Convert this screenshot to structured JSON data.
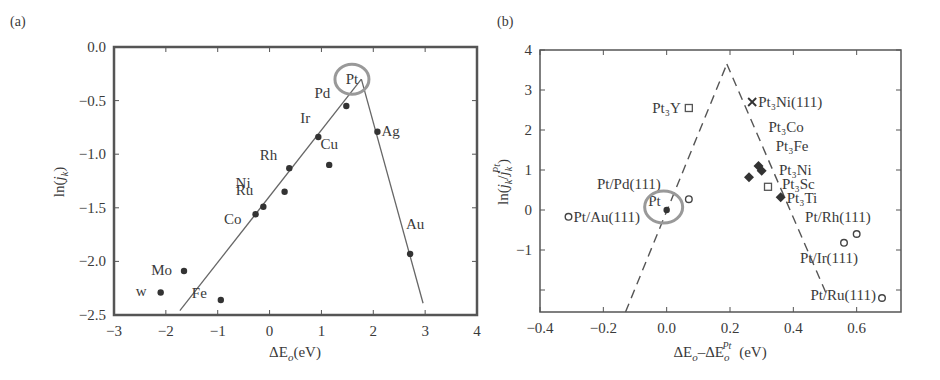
{
  "panels": [
    {
      "label": "(a)"
    },
    {
      "label": "(b)"
    }
  ],
  "chart_data": [
    {
      "type": "scatter",
      "panel_label": "(a)",
      "title": "",
      "xlabel": "ΔE_o (eV)",
      "ylabel": "ln(j_k)",
      "xlim": [
        -3,
        4
      ],
      "ylim": [
        -2.5,
        0.0
      ],
      "xticks": [
        -3,
        -2,
        -1,
        0,
        1,
        2,
        3,
        4
      ],
      "xtick_labels": [
        "−3",
        "−2",
        "−1",
        "0",
        "1",
        "2",
        "3",
        "4"
      ],
      "yticks": [
        0.0,
        -0.5,
        -1.0,
        -1.5,
        -2.0,
        -2.5
      ],
      "ytick_labels": [
        "0.0",
        "−0.5",
        "−1.0",
        "−1.5",
        "−2.0",
        "−2.5"
      ],
      "grid": false,
      "points": [
        {
          "label": "Pd",
          "x": 1.48,
          "y": -0.55,
          "lx": -16,
          "ly": -8,
          "anchor": "end"
        },
        {
          "label": "Ir",
          "x": 0.94,
          "y": -0.84,
          "lx": -8,
          "ly": -14,
          "anchor": "end"
        },
        {
          "label": "Ag",
          "x": 2.08,
          "y": -0.79,
          "lx": 4,
          "ly": 4,
          "anchor": "start"
        },
        {
          "label": "Cu",
          "x": 1.15,
          "y": -1.1,
          "lx": 0,
          "ly": -16,
          "anchor": "middle"
        },
        {
          "label": "Rh",
          "x": 0.38,
          "y": -1.13,
          "lx": -12,
          "ly": -8,
          "anchor": "end"
        },
        {
          "label": "Ni",
          "x": 0.29,
          "y": -1.35,
          "lx": -34,
          "ly": -4,
          "anchor": "end"
        },
        {
          "label": "Ru",
          "x": -0.12,
          "y": -1.49,
          "lx": -10,
          "ly": -12,
          "anchor": "end"
        },
        {
          "label": "Co",
          "x": -0.27,
          "y": -1.56,
          "lx": -14,
          "ly": 10,
          "anchor": "end"
        },
        {
          "label": "Au",
          "x": 2.71,
          "y": -1.93,
          "lx": 5,
          "ly": -25,
          "anchor": "middle"
        },
        {
          "label": "Mo",
          "x": -1.65,
          "y": -2.09,
          "lx": -12,
          "ly": 4,
          "anchor": "end"
        },
        {
          "label": "W",
          "x": -2.1,
          "y": -2.29,
          "lx": -14,
          "ly": 4,
          "anchor": "end",
          "display": "w"
        },
        {
          "label": "Fe",
          "x": -0.94,
          "y": -2.36,
          "lx": -14,
          "ly": -2,
          "anchor": "end"
        }
      ],
      "trend_lines": [
        {
          "style": "solid",
          "x": [
            -1.73,
            1.77
          ],
          "y": [
            -2.46,
            -0.3
          ]
        },
        {
          "style": "solid",
          "x": [
            1.77,
            2.96
          ],
          "y": [
            -0.3,
            -2.39
          ]
        }
      ],
      "annotations": [
        {
          "text": "Pt",
          "x": 1.55,
          "y": -0.3,
          "circled": true
        }
      ]
    },
    {
      "type": "scatter",
      "panel_label": "(b)",
      "title": "",
      "xlabel": "ΔE_o − ΔE_o^Pt (eV)",
      "ylabel": "ln(j_k / j_k^Pt)",
      "xlim": [
        -0.4,
        0.74
      ],
      "ylim": [
        -2.55,
        4
      ],
      "xticks": [
        -0.4,
        -0.2,
        0.0,
        0.2,
        0.4,
        0.6
      ],
      "xtick_labels": [
        "−0.4",
        "−0.2",
        "0.0",
        "0.2",
        "0.4",
        "0.6"
      ],
      "yticks": [
        4,
        3,
        2,
        1,
        0,
        -1,
        -2
      ],
      "ytick_labels": [
        "4",
        "3",
        "2",
        "1",
        "0",
        "−1",
        ""
      ],
      "grid": false,
      "points": [
        {
          "label": "Pt3Y",
          "x": 0.07,
          "y": 2.55,
          "marker": "open-square",
          "lx": -8,
          "ly": 5,
          "anchor": "end",
          "display": "Pt₃Y"
        },
        {
          "label": "Pt3Ni(111)",
          "x": 0.27,
          "y": 2.7,
          "marker": "cross",
          "lx": 6,
          "ly": 5,
          "anchor": "start",
          "display": "Pt₃Ni(111)"
        },
        {
          "label": "Pt3Co",
          "x": 0.29,
          "y": 1.1,
          "marker": "filled-diamond",
          "lx": 10,
          "ly": -34,
          "anchor": "start",
          "display": "Pt₃Co"
        },
        {
          "label": "Pt3Fe",
          "x": 0.3,
          "y": 0.98,
          "marker": "filled-diamond",
          "lx": 14,
          "ly": -20,
          "anchor": "start",
          "display": "Pt₃Fe"
        },
        {
          "label": "Pt3Ni",
          "x": 0.26,
          "y": 0.82,
          "marker": "filled-diamond",
          "lx": 30,
          "ly": -2,
          "anchor": "start",
          "display": "Pt₃Ni"
        },
        {
          "label": "Pt3Sc",
          "x": 0.32,
          "y": 0.58,
          "marker": "open-square",
          "lx": 14,
          "ly": 2,
          "anchor": "start",
          "display": "Pt₃Sc"
        },
        {
          "label": "Pt3Ti",
          "x": 0.36,
          "y": 0.32,
          "marker": "filled-diamond",
          "lx": 6,
          "ly": 6,
          "anchor": "start",
          "display": "Pt₃Ti"
        },
        {
          "label": "Pt/Pd(111)",
          "x": 0.07,
          "y": 0.27,
          "marker": "open-circle",
          "lx": -28,
          "ly": -10,
          "anchor": "end",
          "display": "Pt/Pd(111)"
        },
        {
          "label": "Pt",
          "x": 0.0,
          "y": 0.0,
          "marker": "filled-circle",
          "lx": -6,
          "ly": -4,
          "anchor": "end",
          "display": "Pt"
        },
        {
          "label": "Pt/Au(111)",
          "x": -0.31,
          "y": -0.17,
          "marker": "open-circle",
          "lx": 5,
          "ly": 5,
          "anchor": "start",
          "display": "Pt/Au(111)"
        },
        {
          "label": "Pt/Rh(111)",
          "x": 0.6,
          "y": -0.6,
          "marker": "open-circle",
          "lx": 14,
          "ly": -12,
          "anchor": "end",
          "display": "Pt/Rh(111)"
        },
        {
          "label": "Pt/Ir(111)",
          "x": 0.56,
          "y": -0.82,
          "marker": "open-circle",
          "lx": 14,
          "ly": 20,
          "anchor": "end",
          "display": "Pt/Ir(111)"
        },
        {
          "label": "Pt/Ru(111)",
          "x": 0.68,
          "y": -2.2,
          "marker": "open-circle",
          "lx": -6,
          "ly": 2,
          "anchor": "end",
          "display": "Pt/Ru(111)"
        }
      ],
      "trend_lines": [
        {
          "style": "dashed",
          "x": [
            -0.13,
            0.19
          ],
          "y": [
            -2.55,
            3.65
          ]
        },
        {
          "style": "dashed",
          "x": [
            0.19,
            0.51
          ],
          "y": [
            3.65,
            -2.2
          ]
        }
      ],
      "annotations": [
        {
          "text": "Pt",
          "x": 0.0,
          "y": 0.0,
          "circled": true
        }
      ]
    }
  ]
}
